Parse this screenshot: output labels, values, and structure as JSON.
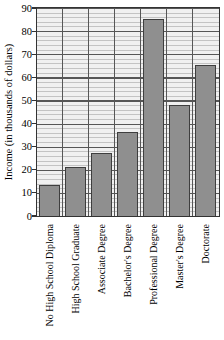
{
  "chart_data": {
    "type": "bar",
    "title": "",
    "xlabel": "",
    "ylabel": "Income (in thousands of dollars)",
    "categories": [
      "No High School Diploma",
      "High School Graduate",
      "Associate Degree",
      "Bachelor's Degree",
      "Professional Degree",
      "Master's Degree",
      "Doctorate"
    ],
    "values": [
      13,
      21,
      27,
      36,
      85,
      48,
      65
    ],
    "ylim": [
      0,
      90
    ],
    "yticks": [
      90,
      80,
      70,
      60,
      50,
      40,
      30,
      20,
      10,
      0
    ],
    "ytick_step": 10,
    "grid": "horizontal major every 10 and minor every 2 units; vertical separators between category columns",
    "legend": "none"
  },
  "colors": {
    "bar_fill": "#8f8f8f",
    "bar_border": "#3e3e3e",
    "plot_background": "#f0f0f0",
    "grid_minor": "#c3c3c3",
    "grid_major": "#565656",
    "frame": "#333333",
    "text": "#000000"
  }
}
